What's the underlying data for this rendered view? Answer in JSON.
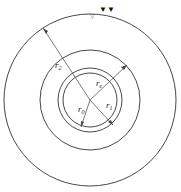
{
  "diagram": {
    "type": "concentric-circles",
    "center": [
      90,
      100
    ],
    "circles": [
      {
        "name": "outer",
        "r": 86
      },
      {
        "name": "middle",
        "r": 50
      },
      {
        "name": "ring-outer",
        "r": 32
      },
      {
        "name": "ring-inner",
        "r": 27
      }
    ],
    "labels": {
      "r2": {
        "main": "r",
        "sub": "2"
      },
      "re": {
        "main": "r",
        "sub": "e"
      },
      "r0": {
        "main": "r",
        "sub": "0"
      },
      "r1": {
        "main": "r",
        "sub": "1"
      }
    },
    "water_table_symbol": "▽",
    "markers": "▼▼",
    "colors": {
      "stroke": "#333333",
      "background": "#ffffff"
    }
  }
}
